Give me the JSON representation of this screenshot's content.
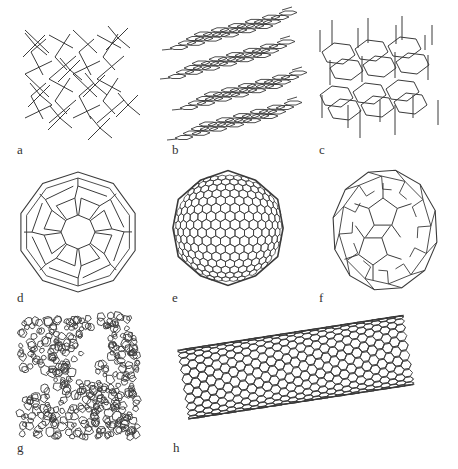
{
  "figure": {
    "stroke_color": "#3a3a3a",
    "background": "#ffffff",
    "panels": [
      {
        "id": "a",
        "label": "a",
        "structure": "diamond"
      },
      {
        "id": "b",
        "label": "b",
        "structure": "graphite"
      },
      {
        "id": "c",
        "label": "c",
        "structure": "lonsdaleite"
      },
      {
        "id": "d",
        "label": "d",
        "structure": "C60 buckminsterfullerene"
      },
      {
        "id": "e",
        "label": "e",
        "structure": "C540 fullerene"
      },
      {
        "id": "f",
        "label": "f",
        "structure": "C70 fullerene"
      },
      {
        "id": "g",
        "label": "g",
        "structure": "amorphous carbon"
      },
      {
        "id": "h",
        "label": "h",
        "structure": "single-walled carbon nanotube"
      }
    ]
  }
}
